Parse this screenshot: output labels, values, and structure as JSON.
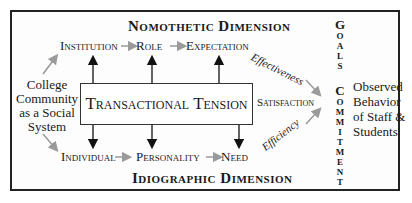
{
  "diagram": {
    "top_dimension": "Nomothetic Dimension",
    "bottom_dimension": "Idiographic Dimension",
    "left_label": [
      "College",
      "Community",
      "as a Social",
      "System"
    ],
    "center_box": "Transactional Tension",
    "top_row": [
      "Institution",
      "Role",
      "Expectation"
    ],
    "bottom_row": [
      "Individual",
      "Personality",
      "Need"
    ],
    "effectiveness": "Effectiveness",
    "efficiency": "Efficiency",
    "satisfaction": "Satisfaction",
    "goals_letters": [
      "G",
      "O",
      "A",
      "L",
      "S"
    ],
    "commitment_letters": [
      "C",
      "O",
      "M",
      "M",
      "I",
      "T",
      "M",
      "E",
      "N",
      "T"
    ],
    "right_label": [
      "Observed",
      "Behavior",
      "of Staff &",
      "Students"
    ]
  },
  "colors": {
    "arrow_gray": "#9a9a9a",
    "arrow_black": "#111111",
    "border": "#222222"
  }
}
